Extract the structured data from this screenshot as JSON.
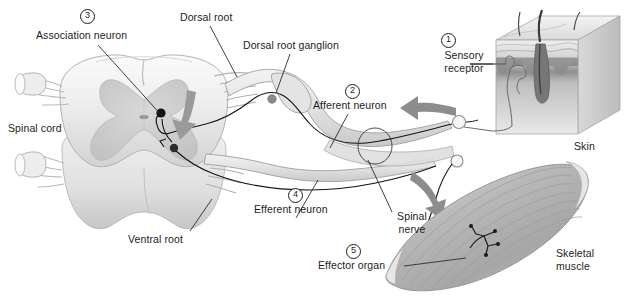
{
  "figure": {
    "background": "#ffffff",
    "width": 625,
    "height": 297
  },
  "labels": {
    "association_neuron": "Association neuron",
    "spinal_cord": "Spinal cord",
    "dorsal_root": "Dorsal root",
    "dorsal_root_ganglion": "Dorsal root ganglion",
    "afferent_neuron": "Afferent neuron",
    "sensory_receptor": "Sensory\nreceptor",
    "skin": "Skin",
    "efferent_neuron": "Efferent neuron",
    "ventral_root": "Ventral root",
    "spinal_nerve": "Spinal\nnerve",
    "effector_organ": "Effector organ",
    "skeletal_muscle": "Skeletal\nmuscle"
  },
  "numbers": {
    "one": "1",
    "two": "2",
    "three": "3",
    "four": "4",
    "five": "5"
  },
  "sequence": [
    {
      "marker": "1",
      "label": "Sensory receptor"
    },
    {
      "marker": "2",
      "label": "Afferent neuron"
    },
    {
      "marker": "3",
      "label": "Association neuron"
    },
    {
      "marker": "4",
      "label": "Efferent neuron"
    },
    {
      "marker": "5",
      "label": "Effector organ"
    }
  ],
  "colors": {
    "ink": "#1c1c1c",
    "leader_line": "#2b2b2b",
    "nerve_outline": "#6f6f6f",
    "nerve_fill": "#e8e8e8",
    "cord_light": "#f4f4f4",
    "cord_mid": "#dcdcdc",
    "gray_matter": "#cfcfcf",
    "arrow_gray": "#8d8d8d",
    "muscle_gray": "#b4b4b4",
    "skin_epidermis": "#9a9a9a",
    "skin_dermis": "#e2e2e2",
    "hair_dark": "#4a4a4a",
    "axon_dark": "#141414"
  },
  "icons": {
    "marker_shape": "numbered-circle",
    "afferent_arrow": "arrow-left-gray",
    "efferent_arrow": "arrow-down-gray",
    "interneuron_arrow": "arrow-down-gray"
  }
}
